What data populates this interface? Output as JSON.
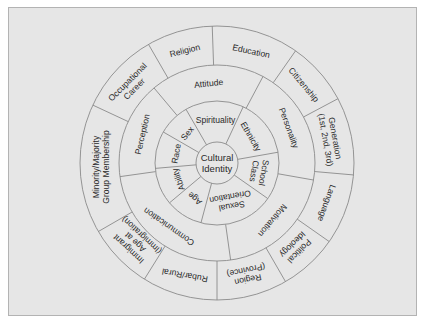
{
  "diagram": {
    "type": "concentric-circle",
    "center_label": [
      "Cultural",
      "Identity"
    ],
    "colors": {
      "background": "#e6e6e6",
      "stroke": "#8a8a8a",
      "text": "#2a2a2a"
    },
    "geometry": {
      "cx": 217,
      "cy": 163,
      "r_center": 21,
      "r_inner": 62,
      "r_middle": 98,
      "r_outer": 137
    },
    "inner_ring": {
      "dividers": [
        25,
        80,
        125,
        195,
        230,
        265,
        300,
        330
      ],
      "sectors": [
        {
          "lines": [
            "Spirituality"
          ],
          "angle": 358,
          "r": 43,
          "rot": 0
        },
        {
          "lines": [
            "Ethnicity"
          ],
          "angle": 52,
          "r": 43,
          "rot": 60
        },
        {
          "lines": [
            "School",
            "Class"
          ],
          "angle": 102,
          "r": 43,
          "rot": 100
        },
        {
          "lines": [
            "Sexual",
            "Orientation"
          ],
          "angle": 160,
          "r": 41,
          "rot": 170
        },
        {
          "lines": [
            "Age"
          ],
          "angle": 212,
          "r": 42,
          "rot": 220
        },
        {
          "lines": [
            "Ability"
          ],
          "angle": 247,
          "r": 42,
          "rot": 250
        },
        {
          "lines": [
            "Race"
          ],
          "angle": 283,
          "r": 42,
          "rot": -80
        },
        {
          "lines": [
            "Sex"
          ],
          "angle": 315,
          "r": 42,
          "rot": -50
        }
      ]
    },
    "middle_ring": {
      "dividers": [
        28,
        100,
        172,
        262,
        320
      ],
      "sectors": [
        {
          "lines": [
            "Attitude"
          ],
          "angle": 354,
          "r": 80,
          "rot": -6
        },
        {
          "lines": [
            "Personality"
          ],
          "angle": 64,
          "r": 80,
          "rot": 70
        },
        {
          "lines": [
            "Motivation"
          ],
          "angle": 136,
          "r": 80,
          "rot": 130
        },
        {
          "lines": [
            "Communication"
          ],
          "angle": 217,
          "r": 80,
          "rot": 215
        },
        {
          "lines": [
            "Perception"
          ],
          "angle": 291,
          "r": 80,
          "rot": -77
        }
      ]
    },
    "outer_ring": {
      "dividers": [
        -2,
        35,
        62,
        95,
        125,
        150,
        180,
        212,
        240,
        295,
        330
      ],
      "sectors": [
        {
          "lines": [
            "Education"
          ],
          "angle": 17,
          "r": 117,
          "rot": 12
        },
        {
          "lines": [
            "Citizenship"
          ],
          "angle": 48,
          "r": 117,
          "rot": 50
        },
        {
          "lines": [
            "Generation",
            "(1st, 2nd, 3rd)"
          ],
          "angle": 78,
          "r": 116,
          "rot": 80
        },
        {
          "lines": [
            "Language"
          ],
          "angle": 110,
          "r": 117,
          "rot": 110
        },
        {
          "lines": [
            "Political",
            "Ideology"
          ],
          "angle": 137,
          "r": 116,
          "rot": 135
        },
        {
          "lines": [
            "Region",
            "(Province)"
          ],
          "angle": 165,
          "r": 116,
          "rot": 168
        },
        {
          "lines": [
            "Rubar/Rural"
          ],
          "angle": 196,
          "r": 117,
          "rot": 190
        },
        {
          "lines": [
            "Immigrant",
            "Age at",
            "(Immigration)"
          ],
          "angle": 226,
          "r": 114,
          "rot": 223
        },
        {
          "lines": [
            "Minority/Majority",
            "Group Membership"
          ],
          "angle": 268,
          "r": 116,
          "rot": -90
        },
        {
          "lines": [
            "Occupational",
            "Career"
          ],
          "angle": 312,
          "r": 116,
          "rot": -45
        },
        {
          "lines": [
            "Religion"
          ],
          "angle": 344,
          "r": 117,
          "rot": -14
        }
      ]
    }
  }
}
